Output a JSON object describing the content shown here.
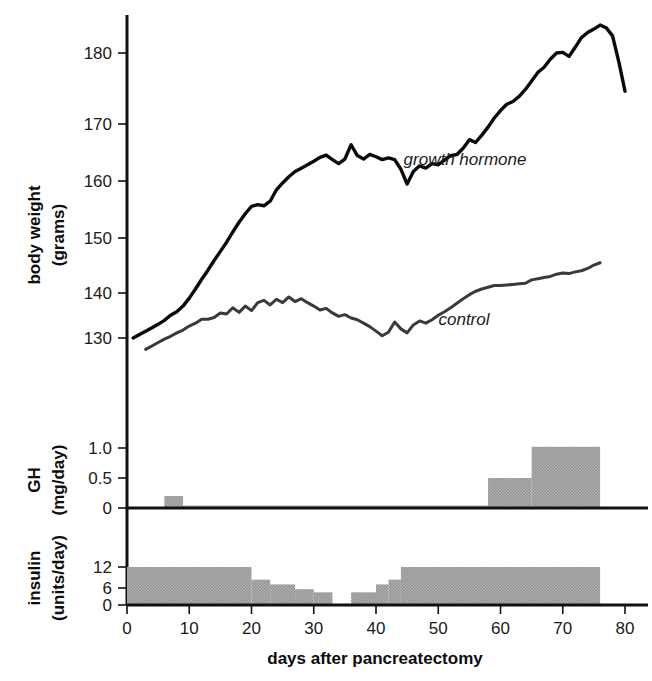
{
  "figure": {
    "xlabel": "days after pancreatectomy",
    "background": "#ffffff",
    "ink_color": "#111111",
    "bar_color": "#a3a3a3"
  },
  "panels": {
    "weight": {
      "ylabel_line1": "body weight",
      "ylabel_line2": "(grams)",
      "yticks": [
        "130",
        "140",
        "150",
        "160",
        "170",
        "180"
      ],
      "label_growth_hormone": "growth hormone",
      "label_control": "control"
    },
    "gh": {
      "ylabel_line1": "GH",
      "ylabel_line2": "(mg/day)",
      "yticks": [
        "0",
        "0.5",
        "1.0"
      ]
    },
    "insulin": {
      "ylabel_line1": "insulin",
      "ylabel_line2": "(units/day)",
      "yticks": [
        "0",
        "6",
        "12"
      ]
    }
  },
  "xaxis": {
    "ticks": [
      "0",
      "10",
      "20",
      "30",
      "40",
      "50",
      "60",
      "70",
      "80"
    ],
    "min": 0,
    "max": 85
  },
  "chart_data": [
    {
      "type": "line",
      "id": "body-weight",
      "title": "body weight (grams) vs days after pancreatectomy",
      "xlabel": "days after pancreatectomy",
      "ylabel": "body weight (grams)",
      "xlim": [
        0,
        85
      ],
      "ylim": [
        125,
        187
      ],
      "grid": false,
      "legend": "inline-annotations",
      "series": [
        {
          "name": "growth hormone",
          "color": "#0a0a0a",
          "x": [
            1,
            2,
            3,
            4,
            5,
            6,
            7,
            8,
            9,
            10,
            11,
            12,
            13,
            14,
            15,
            16,
            17,
            18,
            19,
            20,
            21,
            22,
            23,
            24,
            25,
            26,
            27,
            28,
            29,
            30,
            31,
            32,
            33,
            34,
            35,
            36,
            37,
            38,
            39,
            40,
            41,
            42,
            43,
            44,
            45,
            46,
            47,
            48,
            49,
            50,
            51,
            52,
            53,
            54,
            55,
            56,
            57,
            58,
            59,
            60,
            61,
            62,
            63,
            64,
            65,
            66,
            67,
            68,
            69,
            70,
            71,
            72,
            73,
            74,
            75,
            76,
            77,
            78,
            79,
            80
          ],
          "y": [
            130.0,
            130.6,
            131.2,
            131.8,
            132.4,
            133.1,
            134.0,
            134.6,
            135.6,
            137.0,
            138.6,
            140.3,
            141.9,
            143.6,
            145.2,
            146.8,
            148.6,
            150.3,
            151.8,
            153.1,
            153.4,
            153.2,
            154.0,
            156.0,
            157.2,
            158.3,
            159.2,
            159.8,
            160.4,
            161.0,
            161.7,
            162.1,
            161.3,
            160.6,
            161.4,
            163.9,
            162.0,
            161.4,
            162.2,
            161.8,
            161.3,
            161.6,
            161.3,
            159.6,
            157.0,
            159.2,
            160.2,
            159.8,
            160.6,
            160.4,
            161.2,
            162.0,
            162.2,
            163.3,
            164.8,
            164.3,
            165.6,
            167.0,
            168.6,
            169.9,
            171.0,
            171.5,
            172.4,
            173.6,
            175.1,
            176.6,
            177.5,
            178.9,
            180.0,
            180.1,
            179.4,
            181.0,
            182.7,
            183.6,
            184.2,
            184.9,
            184.4,
            183.0,
            178.5,
            173.3
          ]
        },
        {
          "name": "control",
          "color": "#3a3a3a",
          "x": [
            3,
            4,
            5,
            6,
            7,
            8,
            9,
            10,
            11,
            12,
            13,
            14,
            15,
            16,
            17,
            18,
            19,
            20,
            21,
            22,
            23,
            24,
            25,
            26,
            27,
            28,
            29,
            30,
            31,
            32,
            33,
            34,
            35,
            36,
            37,
            38,
            39,
            40,
            41,
            42,
            43,
            44,
            45,
            46,
            47,
            48,
            49,
            50,
            51,
            52,
            53,
            54,
            55,
            56,
            57,
            58,
            59,
            60,
            61,
            62,
            63,
            64,
            65,
            66,
            67,
            68,
            69,
            70,
            71,
            72,
            73,
            74,
            75,
            76
          ],
          "y": [
            128.0,
            128.6,
            129.2,
            129.8,
            130.3,
            130.9,
            131.4,
            132.1,
            132.6,
            133.3,
            133.3,
            133.6,
            134.4,
            134.2,
            135.3,
            134.5,
            135.6,
            134.8,
            136.2,
            136.6,
            135.8,
            136.8,
            136.2,
            137.2,
            136.4,
            136.9,
            136.2,
            135.6,
            134.9,
            135.2,
            134.4,
            133.8,
            134.1,
            133.5,
            133.2,
            132.6,
            132.0,
            131.2,
            130.4,
            131.0,
            132.8,
            131.6,
            130.9,
            132.3,
            133.0,
            132.6,
            133.2,
            134.0,
            134.6,
            135.3,
            136.1,
            136.9,
            137.6,
            138.2,
            138.6,
            138.9,
            139.2,
            139.2,
            139.3,
            139.4,
            139.5,
            139.6,
            140.2,
            140.4,
            140.6,
            140.8,
            141.2,
            141.4,
            141.3,
            141.6,
            141.8,
            142.2,
            142.8,
            143.2
          ]
        }
      ]
    },
    {
      "type": "bar",
      "id": "gh-dose",
      "title": "GH (mg/day) administered",
      "xlabel": "days after pancreatectomy",
      "ylabel": "GH (mg/day)",
      "xlim": [
        0,
        85
      ],
      "ylim": [
        0,
        1.15
      ],
      "grid": false,
      "steps": [
        {
          "x_start": 0,
          "x_end": 6,
          "value": 0.0
        },
        {
          "x_start": 6,
          "x_end": 9,
          "value": 0.2
        },
        {
          "x_start": 9,
          "x_end": 58,
          "value": 0.04
        },
        {
          "x_start": 58,
          "x_end": 65,
          "value": 0.5
        },
        {
          "x_start": 65,
          "x_end": 76,
          "value": 1.02
        },
        {
          "x_start": 76,
          "x_end": 85,
          "value": 0.0
        }
      ]
    },
    {
      "type": "bar",
      "id": "insulin-dose",
      "title": "insulin (units/day) administered",
      "xlabel": "days after pancreatectomy",
      "ylabel": "insulin (units/day)",
      "xlim": [
        0,
        85
      ],
      "ylim": [
        0,
        13.5
      ],
      "grid": false,
      "steps": [
        {
          "x_start": 0,
          "x_end": 20,
          "value": 12
        },
        {
          "x_start": 20,
          "x_end": 23,
          "value": 8
        },
        {
          "x_start": 23,
          "x_end": 27,
          "value": 6.5
        },
        {
          "x_start": 27,
          "x_end": 30,
          "value": 5
        },
        {
          "x_start": 30,
          "x_end": 33,
          "value": 4
        },
        {
          "x_start": 33,
          "x_end": 36,
          "value": 0
        },
        {
          "x_start": 36,
          "x_end": 40,
          "value": 4
        },
        {
          "x_start": 40,
          "x_end": 42,
          "value": 6.5
        },
        {
          "x_start": 42,
          "x_end": 44,
          "value": 8
        },
        {
          "x_start": 44,
          "x_end": 76,
          "value": 12
        },
        {
          "x_start": 76,
          "x_end": 85,
          "value": 0
        }
      ]
    }
  ]
}
